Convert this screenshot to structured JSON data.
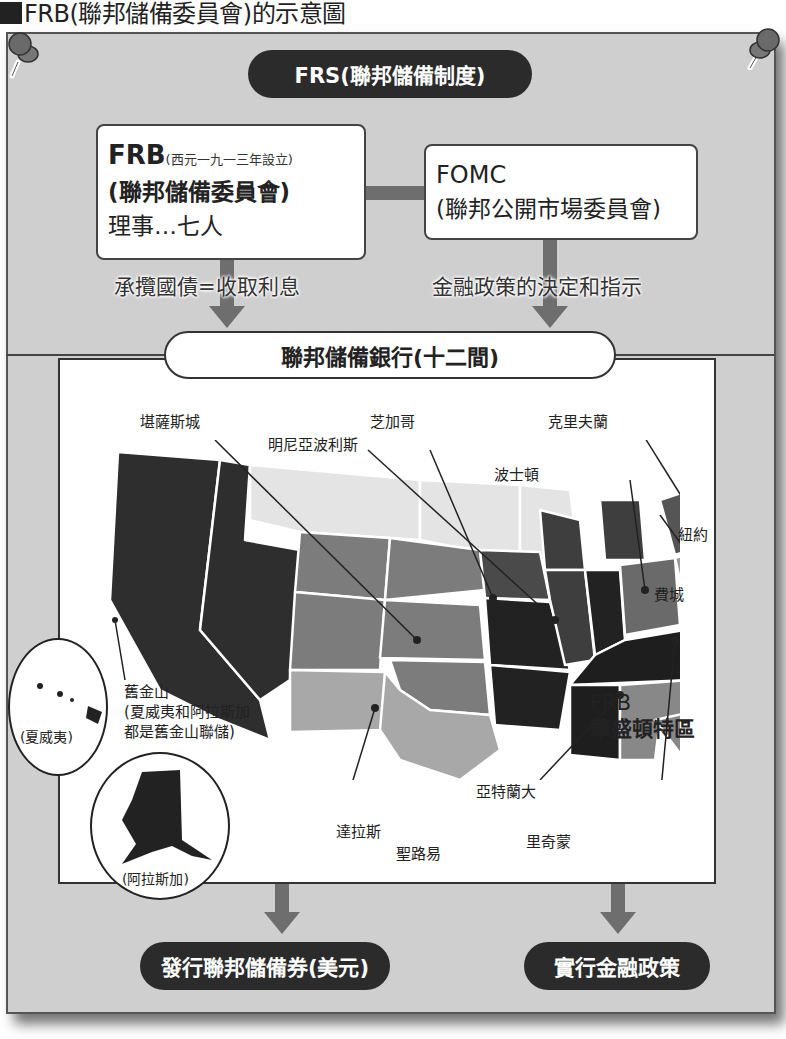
{
  "page_title": "FRB(聯邦儲備委員會)的示意圖",
  "top_pill": "FRS(聯邦儲備制度)",
  "frb_box": {
    "title": "FRB",
    "note": "(西元一九一三年設立)",
    "name": "(聯邦儲備委員會)",
    "members": "理事…七人"
  },
  "fomc_box": {
    "title": "FOMC",
    "name": "(聯邦公開市場委員會)"
  },
  "flow_labels": {
    "left": "承攬國債=收取利息",
    "right": "金融政策的決定和指示"
  },
  "bank_pill": "聯邦儲備銀行(十二間)",
  "map": {
    "cities": [
      {
        "id": "kansas-city",
        "label": "堪薩斯城"
      },
      {
        "id": "chicago",
        "label": "芝加哥"
      },
      {
        "id": "minneapolis",
        "label": "明尼亞波利斯"
      },
      {
        "id": "cleveland",
        "label": "克里夫蘭"
      },
      {
        "id": "boston",
        "label": "波士頓"
      },
      {
        "id": "new-york",
        "label": "紐約"
      },
      {
        "id": "philadelphia",
        "label": "費城"
      },
      {
        "id": "washington",
        "label": "FRB"
      },
      {
        "id": "washington2",
        "label": "華盛頓特區"
      },
      {
        "id": "san-francisco",
        "label": "舊金山"
      },
      {
        "id": "sf-note1",
        "label": "(夏威夷和阿拉斯加"
      },
      {
        "id": "sf-note2",
        "label": "都是舊金山聯儲)"
      },
      {
        "id": "atlanta",
        "label": "亞特蘭大"
      },
      {
        "id": "dallas",
        "label": "達拉斯"
      },
      {
        "id": "st-louis",
        "label": "聖路易"
      },
      {
        "id": "richmond",
        "label": "里奇蒙"
      }
    ],
    "insets": {
      "hawaii": "(夏威夷)",
      "alaska": "(阿拉斯加)"
    }
  },
  "outputs": {
    "left": "發行聯邦儲備券(美元)",
    "right": "實行金融政策"
  },
  "colors": {
    "board": "#cfcfcf",
    "dark": "#2b2b2b",
    "arrow": "#6e6e6e"
  }
}
